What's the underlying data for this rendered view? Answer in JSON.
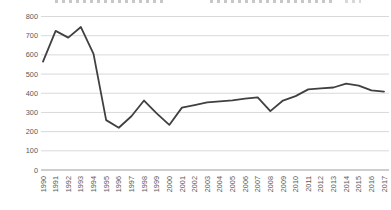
{
  "chart_data": {
    "type": "line",
    "x": [
      "1990",
      "1991",
      "1992",
      "1993",
      "1994",
      "1995",
      "1996",
      "1997",
      "1998",
      "1999",
      "2000",
      "2001",
      "2002",
      "2003",
      "2004",
      "2005",
      "2006",
      "2007",
      "2008",
      "2009",
      "2010",
      "2011",
      "2012",
      "2013",
      "2014",
      "2015",
      "2016",
      "2017"
    ],
    "values": [
      565,
      725,
      690,
      745,
      605,
      260,
      220,
      280,
      362,
      295,
      235,
      325,
      338,
      352,
      358,
      363,
      372,
      378,
      307,
      362,
      385,
      420,
      425,
      430,
      450,
      440,
      415,
      408
    ],
    "title": "",
    "xlabel": "",
    "ylabel": "",
    "ylim": [
      0,
      800
    ],
    "yticks": [
      800,
      700,
      600,
      500,
      400,
      300,
      200,
      100,
      0
    ],
    "grid": "horizontal",
    "legend": "none",
    "line_color": "#404040",
    "gridline_color": "#d9d9d9",
    "axis_line_color": "#9e9e9e",
    "tick_label_color": "#595959"
  }
}
